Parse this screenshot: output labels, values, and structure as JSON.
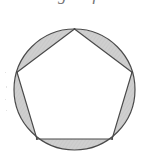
{
  "figure": {
    "caption_fragment": "total angle of",
    "shape_primary": "circle",
    "shape_inscribed": "regular-pentagon",
    "segment_count": 5,
    "colors": {
      "background": "#ffffff",
      "stroke": "#4a4a4a",
      "segment_fill": "#cfcfcf",
      "polygon_fill": "#ffffff"
    },
    "geometry": {
      "center_x": 74.5,
      "center_y": 89.5,
      "radius": 60.5,
      "rotation_deg": -90,
      "stroke_width": 1.1
    },
    "vertices": [
      {
        "label": "top",
        "x": 74.5,
        "y": 29.0
      },
      {
        "label": "right",
        "x": 132.0,
        "y": 72.2
      },
      {
        "label": "bottom-right",
        "x": 112.1,
        "y": 139.0
      },
      {
        "label": "bottom-left",
        "x": 36.9,
        "y": 139.0
      },
      {
        "label": "left",
        "x": 17.0,
        "y": 72.2
      }
    ],
    "segments": [
      {
        "name": "segment-top-right",
        "shaded": true
      },
      {
        "name": "segment-right",
        "shaded": true
      },
      {
        "name": "segment-bottom",
        "shaded": true
      },
      {
        "name": "segment-left",
        "shaded": true
      },
      {
        "name": "segment-top-left",
        "shaded": true
      }
    ]
  }
}
